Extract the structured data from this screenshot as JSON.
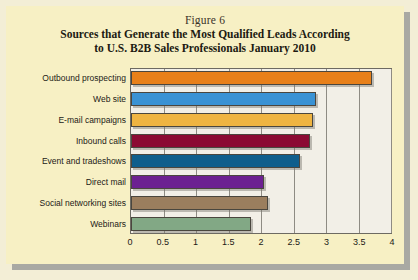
{
  "figure": {
    "label": "Figure 6",
    "title_line1": "Sources that Generate the Most Qualified Leads According",
    "title_line2": "to U.S. B2B Sales Professionals January 2010"
  },
  "colors": {
    "page_background": "#f7f0c4",
    "plot_background": "#f2efe7",
    "frame": "#6d6a62",
    "gridline": "#8e8b83"
  },
  "chart_data": {
    "type": "bar",
    "orientation": "horizontal",
    "title": "Sources that Generate the Most Qualified Leads According to U.S. B2B Sales Professionals January 2010",
    "xlabel": "",
    "ylabel": "",
    "xlim": [
      0,
      4
    ],
    "grid": true,
    "legend": "none",
    "tick_labels": [
      "0",
      "0.5",
      "1",
      "1.5",
      "2",
      "2.5",
      "3",
      "3.5",
      "4"
    ],
    "ticks": [
      0,
      0.5,
      1,
      1.5,
      2,
      2.5,
      3,
      3.5,
      4
    ],
    "categories": [
      "Outbound prospecting",
      "Web site",
      "E-mail campaigns",
      "Inbound calls",
      "Event and tradeshows",
      "Direct mail",
      "Social networking sites",
      "Webinars"
    ],
    "values": [
      3.7,
      2.85,
      2.8,
      2.75,
      2.6,
      2.05,
      2.1,
      1.85
    ],
    "bar_colors": [
      "#e8801a",
      "#3a92d4",
      "#efb442",
      "#8b0a33",
      "#0f5e8c",
      "#6c2091",
      "#9b7e5e",
      "#82a885"
    ]
  }
}
